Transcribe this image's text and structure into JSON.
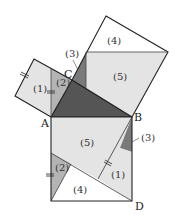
{
  "diagram": {
    "vertices": {
      "A": "A",
      "B": "B",
      "C": "C",
      "D": "D"
    },
    "piece_labels": {
      "p1": "(1)",
      "p2": "(2)",
      "p3": "(3)",
      "p4": "(4)",
      "p5": "(5)"
    },
    "colors": {
      "triangle": "#555555",
      "piece_light": "#e4e4e4",
      "piece_mid": "#b4b4b4",
      "piece_dark": "#7a7a7a",
      "piece_white": "#ffffff",
      "line": "#222222"
    }
  }
}
